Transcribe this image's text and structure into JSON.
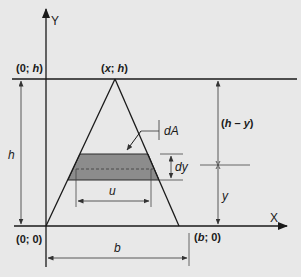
{
  "diagram": {
    "type": "triangle-area-element",
    "axes": {
      "x_label": "X",
      "y_label": "Y"
    },
    "points": {
      "origin": "(0; 0)",
      "top_left": "(0; h)",
      "apex": "(x; h)",
      "base_right": "(b; 0)"
    },
    "point_parts": {
      "origin": {
        "open": "(0; ",
        "var": "0",
        "close": ")"
      },
      "top_left": {
        "open": "(0; ",
        "var": "h",
        "close": ")"
      },
      "apex": {
        "open": "(",
        "var1": "x",
        "sep": "; ",
        "var2": "h",
        "close": ")"
      },
      "base_right": {
        "open": "(",
        "var": "b",
        "close": "; 0)"
      }
    },
    "dimensions": {
      "height": "h",
      "base": "b",
      "strip_width": "u",
      "strip_thickness": "dy",
      "strip_distance": "y",
      "remaining_height": "(h – y)",
      "remaining_height_parts": {
        "open": "(",
        "a": "h",
        "minus": " – ",
        "b": "y",
        "close": ")"
      }
    },
    "element_label": "dA",
    "colors": {
      "background": "#e8e8e8",
      "lines": "#1a1a1a",
      "strip_fill": "#8c8c8c",
      "dim_lines": "#333333"
    }
  }
}
